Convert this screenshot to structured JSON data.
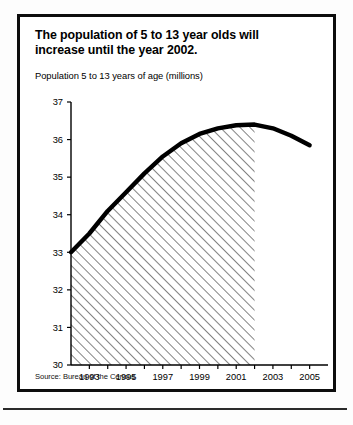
{
  "panel": {
    "title_line1": "The population of 5 to 13 year olds will",
    "title_line2": "increase until the year 2002.",
    "subtitle": "Population 5 to 13 years of age (millions)",
    "source": "Source: Bureau of the Census"
  },
  "chart_data": {
    "type": "line",
    "title": "The population of 5 to 13 year olds will increase until the year 2002.",
    "subtitle": "Population 5 to 13 years of age (millions)",
    "xlabel": "",
    "ylabel": "Population 5 to 13 years of age (millions)",
    "ylim": [
      30,
      37
    ],
    "xlim": [
      1992,
      2006
    ],
    "yticks": [
      30,
      31,
      32,
      33,
      34,
      35,
      36,
      37
    ],
    "ytick_labels": [
      "30",
      "31",
      "32",
      "33",
      "34",
      "35",
      "36",
      "37"
    ],
    "xticks": [
      1993,
      1994,
      1995,
      1996,
      1997,
      1998,
      1999,
      2000,
      2001,
      2002,
      2003,
      2004,
      2005
    ],
    "xtick_labels": [
      "1993",
      "",
      "1995",
      "",
      "1997",
      "",
      "1999",
      "",
      "2001",
      "",
      "2003",
      "",
      "2005"
    ],
    "x": [
      1992,
      1993,
      1994,
      1995,
      1996,
      1997,
      1998,
      1999,
      2000,
      2001,
      2002,
      2003,
      2004,
      2005
    ],
    "values": [
      33.0,
      33.5,
      34.1,
      34.6,
      35.1,
      35.55,
      35.9,
      36.15,
      36.3,
      36.38,
      36.4,
      36.3,
      36.1,
      35.85
    ],
    "series": [
      {
        "name": "Population 5 to 13 years of age (millions)",
        "values": [
          33.0,
          33.5,
          34.1,
          34.6,
          35.1,
          35.55,
          35.9,
          36.15,
          36.3,
          36.38,
          36.4,
          36.3,
          36.1,
          35.85
        ]
      }
    ],
    "fill": {
      "pattern": "diagonal-hatch",
      "from_x": 1992,
      "to_x": 2002,
      "baseline": 30
    },
    "grid": false,
    "legend": false,
    "line_color": "#000000",
    "peak_year": 2002,
    "peak_value": 36.4
  }
}
